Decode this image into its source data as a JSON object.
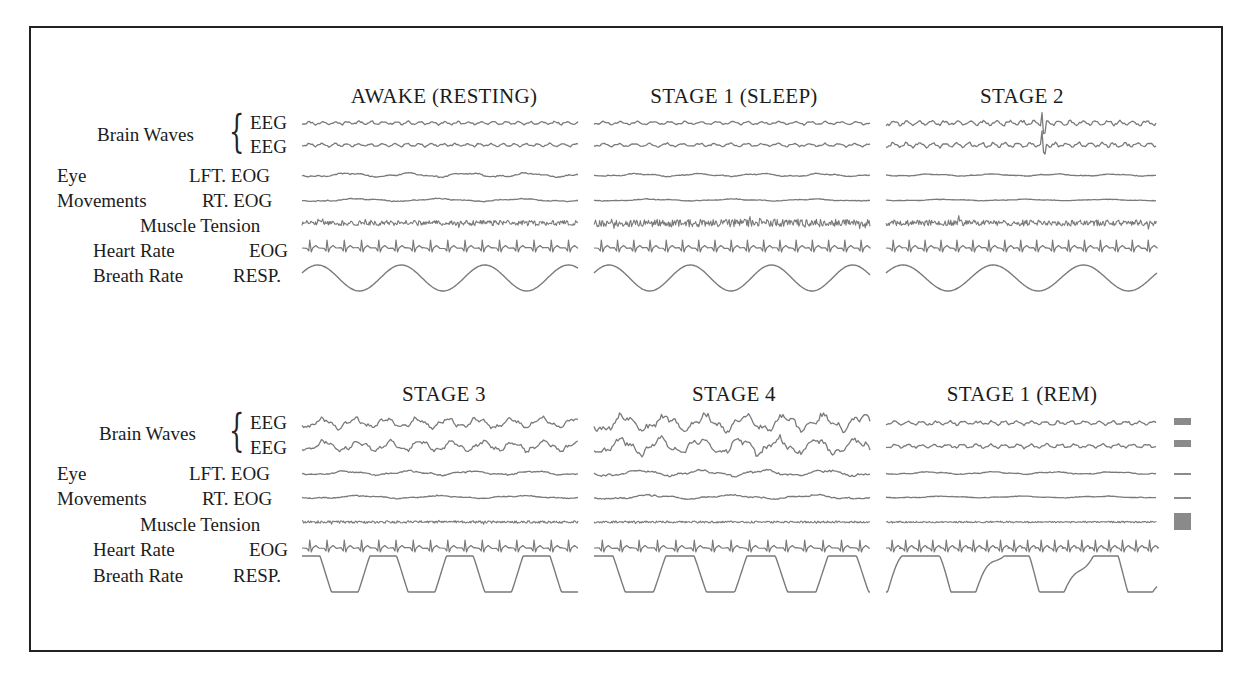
{
  "figure": {
    "trace_color": "#7a7a7a",
    "calibration_color": "#8a8a8a"
  },
  "row_labels": {
    "brain_waves": "Brain Waves",
    "eeg_1": "EEG",
    "eeg_2": "EEG",
    "eye": "Eye",
    "movements": "Movements",
    "lft_eog": "LFT. EOG",
    "rt_eog": "RT. EOG",
    "muscle_tension": "Muscle Tension",
    "heart_rate": "Heart Rate",
    "heart_channel": "EOG",
    "breath_rate": "Breath Rate",
    "resp_channel": "RESP."
  },
  "panels": [
    {
      "id": "awake",
      "title": "AWAKE (RESTING)",
      "x0": 302,
      "x1": 578,
      "row": 0,
      "eeg_amp": 1.6,
      "eeg_freq": 0.9,
      "eog_amp": 2.0,
      "muscle_amp": 2.6,
      "heart_beats": 16,
      "resp": "sine",
      "resp_cycles": 3.3,
      "spikes": []
    },
    {
      "id": "stage1",
      "title": "STAGE 1 (SLEEP)",
      "x0": 594,
      "x1": 870,
      "row": 0,
      "eeg_amp": 1.6,
      "eeg_freq": 0.7,
      "eog_amp": 1.4,
      "muscle_amp": 4.0,
      "heart_beats": 17,
      "resp": "sine",
      "resp_cycles": 3.4,
      "spikes": []
    },
    {
      "id": "stage2",
      "title": "STAGE 2",
      "x0": 886,
      "x1": 1157,
      "row": 0,
      "eeg_amp": 2.4,
      "eeg_freq": 0.9,
      "eog_amp": 1.0,
      "muscle_amp": 3.0,
      "heart_beats": 17,
      "resp": "sine",
      "resp_cycles": 3.0,
      "spikes": [
        0.58
      ]
    },
    {
      "id": "stage3",
      "title": "STAGE 3",
      "x0": 302,
      "x1": 578,
      "row": 1,
      "eeg_amp": 5.0,
      "eeg_freq": 0.35,
      "eog_amp": 2.0,
      "muscle_amp": 1.2,
      "heart_beats": 16,
      "resp": "plateau",
      "resp_cycles": 3.6,
      "spikes": []
    },
    {
      "id": "stage4",
      "title": "STAGE 4",
      "x0": 594,
      "x1": 870,
      "row": 1,
      "eeg_amp": 8.0,
      "eeg_freq": 0.28,
      "eog_amp": 3.0,
      "muscle_amp": 1.0,
      "heart_beats": 15,
      "resp": "plateau",
      "resp_cycles": 3.4,
      "spikes": []
    },
    {
      "id": "rem",
      "title": "STAGE 1 (REM)",
      "x0": 886,
      "x1": 1157,
      "row": 1,
      "eeg_amp": 2.0,
      "eeg_freq": 0.8,
      "eog_amp": 1.2,
      "muscle_amp": 0.8,
      "heart_beats": 20,
      "resp": "irregular",
      "resp_cycles": 3.0,
      "spikes": []
    }
  ],
  "layout": {
    "rows": [
      {
        "title_y": 88,
        "eeg1": 123,
        "eeg2": 145,
        "lft": 175,
        "rt": 200,
        "muscle": 223,
        "heart": 248,
        "resp_top": 265,
        "resp_bot": 291
      },
      {
        "title_y": 385,
        "eeg1": 423,
        "eeg2": 446,
        "lft": 473,
        "rt": 497,
        "muscle": 522,
        "heart": 548,
        "resp_top": 556,
        "resp_bot": 592
      }
    ]
  },
  "calibration_marks": [
    {
      "label": "eeg1-cal",
      "x": 1174,
      "y": 418,
      "w": 17,
      "h": 7
    },
    {
      "label": "eeg2-cal",
      "x": 1174,
      "y": 440,
      "w": 17,
      "h": 7
    },
    {
      "label": "lft-eog-cal",
      "x": 1174,
      "y": 473,
      "w": 17,
      "h": 2
    },
    {
      "label": "rt-eog-cal",
      "x": 1174,
      "y": 497,
      "w": 17,
      "h": 2
    },
    {
      "label": "muscle-cal",
      "x": 1174,
      "y": 513,
      "w": 17,
      "h": 17
    }
  ]
}
